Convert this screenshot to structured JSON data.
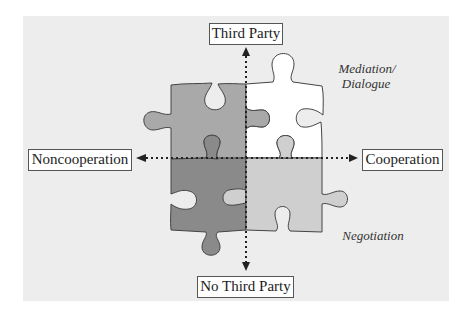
{
  "diagram": {
    "type": "quadrant puzzle diagram",
    "axes": {
      "top": "Third Party",
      "bottom": "No Third Party",
      "left": "Noncooperation",
      "right": "Cooperation"
    },
    "quadrant_labels": {
      "top_right": "Mediation/\nDialogue",
      "top_right_line1": "Mediation/",
      "top_right_line2": "Dialogue",
      "bottom_right": "Negotiation"
    },
    "pieces": [
      {
        "position": "top-left",
        "fill": "#a9a9a9"
      },
      {
        "position": "top-right",
        "fill": "#ffffff"
      },
      {
        "position": "bottom-left",
        "fill": "#8a8a8a"
      },
      {
        "position": "bottom-right",
        "fill": "#cfcfcf"
      }
    ],
    "colors": {
      "background_panel": "#ededed",
      "outline": "#444444",
      "axis": "#222222"
    }
  }
}
